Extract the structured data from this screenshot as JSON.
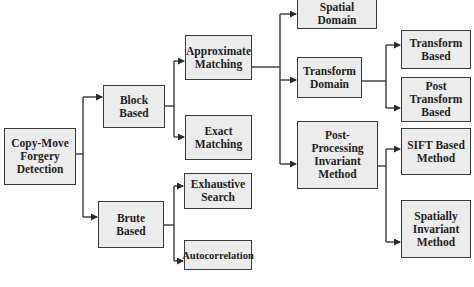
{
  "diagram": {
    "type": "hierarchical-taxonomy",
    "colors": {
      "box_fill": "#ececec",
      "box_border": "#3a3a3a",
      "line": "#2a2a2a",
      "text": "#1e1e1e"
    },
    "nodes": {
      "root": "Copy-Move Forgery Detection",
      "block_based": "Block Based",
      "brute_based": "Brute Based",
      "approximate_matching": "Approximate Matching",
      "exact_matching": "Exact Matching",
      "exhaustive_search": "Exhaustive Search",
      "autocorrelation": "Autocorrelation",
      "spatial_domain": "Spatial Domain",
      "transform_domain": "Transform Domain",
      "post_processing_invariant": "Post-Processing Invariant Method",
      "transform_based": "Transform Based",
      "post_transform_based": "Post Transform Based",
      "sift_based": "SIFT Based Method",
      "spatially_invariant": "Spatially Invariant Method"
    },
    "edges": [
      [
        "root",
        "block_based"
      ],
      [
        "root",
        "brute_based"
      ],
      [
        "block_based",
        "approximate_matching"
      ],
      [
        "block_based",
        "exact_matching"
      ],
      [
        "brute_based",
        "exhaustive_search"
      ],
      [
        "brute_based",
        "autocorrelation"
      ],
      [
        "approximate_matching",
        "spatial_domain"
      ],
      [
        "approximate_matching",
        "transform_domain"
      ],
      [
        "approximate_matching",
        "post_processing_invariant"
      ],
      [
        "transform_domain",
        "transform_based"
      ],
      [
        "transform_domain",
        "post_transform_based"
      ],
      [
        "post_processing_invariant",
        "sift_based"
      ],
      [
        "post_processing_invariant",
        "spatially_invariant"
      ]
    ]
  }
}
